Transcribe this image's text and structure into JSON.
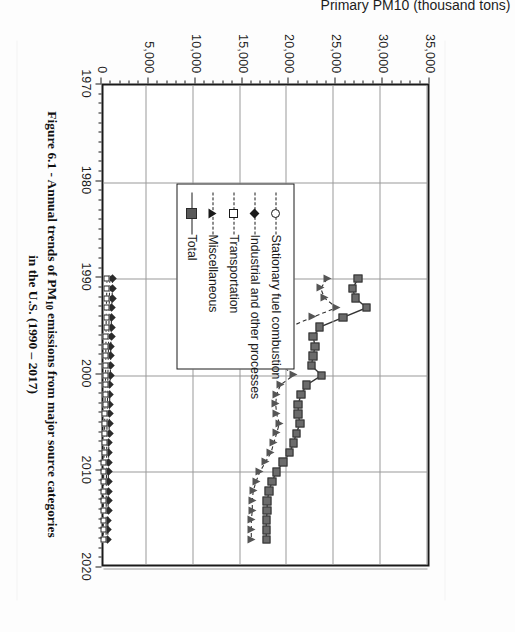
{
  "figure": {
    "caption_line1_a": "Figure 6.1 - Annual trends of PM",
    "caption_sub": "10",
    "caption_line1_b": " emissions from major source categories",
    "caption_line2": "in the U.S. (1990 – 2017)"
  },
  "axis": {
    "y_title": "Primary PM10 (thousand tons)",
    "y_ticks": [
      "35,000",
      "30,000",
      "25,000",
      "20,000",
      "15,000",
      "10,000",
      "5,000",
      "0"
    ],
    "x_ticks": [
      "1970",
      "1980",
      "1990",
      "2000",
      "2010",
      "2020"
    ]
  },
  "legend": {
    "items": [
      {
        "label": "Stationary fuel combustion",
        "marker": "open-circle-icon",
        "line": "dashed"
      },
      {
        "label": "Industrial and other processes",
        "marker": "filled-diamond-icon",
        "line": "dashed"
      },
      {
        "label": "Transportation",
        "marker": "open-square-icon",
        "line": "dashed"
      },
      {
        "label": "Miscellaneous",
        "marker": "filled-triangle-icon",
        "line": "dashed"
      },
      {
        "label": "Total",
        "marker": "filled-square-icon",
        "line": "solid"
      }
    ]
  },
  "chart_data": {
    "type": "line",
    "title": "Figure 6.1 - Annual trends of PM10 emissions from major source categories in the U.S. (1990 – 2017)",
    "xlabel": "",
    "ylabel": "Primary PM10 (thousand tons)",
    "xlim": [
      1970,
      2020
    ],
    "ylim": [
      0,
      35000
    ],
    "ytick_step": 5000,
    "xtick_step": 10,
    "grid": true,
    "legend_position": "inside-lower-left",
    "x": [
      1990,
      1991,
      1992,
      1993,
      1994,
      1995,
      1996,
      1997,
      1998,
      1999,
      2000,
      2001,
      2002,
      2003,
      2004,
      2005,
      2006,
      2007,
      2008,
      2009,
      2010,
      2011,
      2012,
      2013,
      2014,
      2015,
      2016,
      2017
    ],
    "series": [
      {
        "name": "Total",
        "marker": "filled-square",
        "line": "solid",
        "values": [
          27600,
          27000,
          27300,
          28500,
          26000,
          23500,
          22800,
          23000,
          22800,
          22600,
          23700,
          22100,
          21500,
          21200,
          21200,
          21400,
          21000,
          20700,
          20300,
          19600,
          18900,
          18400,
          18100,
          17900,
          17900,
          17800,
          17800,
          17800
        ]
      },
      {
        "name": "Miscellaneous",
        "marker": "filled-triangle",
        "line": "dashed",
        "values": [
          24300,
          23600,
          24000,
          25300,
          22700,
          20300,
          19600,
          19800,
          19700,
          19500,
          20700,
          19300,
          18900,
          18800,
          18900,
          19200,
          18900,
          18600,
          18300,
          17700,
          17100,
          16700,
          16400,
          16300,
          16300,
          16200,
          16200,
          16200
        ]
      },
      {
        "name": "Stationary fuel combustion",
        "marker": "open-circle",
        "line": "dashed",
        "values": [
          1100,
          1080,
          1060,
          1040,
          1020,
          1000,
          980,
          960,
          940,
          920,
          900,
          880,
          860,
          840,
          820,
          800,
          790,
          780,
          770,
          760,
          750,
          740,
          730,
          720,
          710,
          700,
          700,
          700
        ]
      },
      {
        "name": "Industrial and other processes",
        "marker": "filled-diamond",
        "line": "dashed",
        "values": [
          1400,
          1370,
          1340,
          1310,
          1280,
          1250,
          1230,
          1210,
          1190,
          1170,
          1150,
          1120,
          1100,
          1080,
          1060,
          1040,
          1020,
          1000,
          980,
          960,
          950,
          940,
          930,
          920,
          910,
          900,
          900,
          900
        ]
      },
      {
        "name": "Transportation",
        "marker": "open-square",
        "line": "dashed",
        "values": [
          800,
          780,
          760,
          740,
          720,
          700,
          690,
          680,
          670,
          660,
          650,
          630,
          610,
          590,
          570,
          550,
          530,
          510,
          490,
          470,
          450,
          440,
          430,
          420,
          410,
          400,
          400,
          400
        ]
      }
    ]
  }
}
